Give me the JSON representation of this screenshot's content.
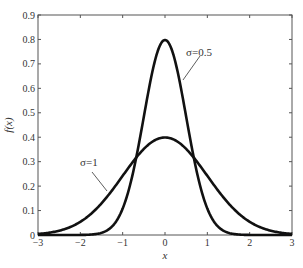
{
  "chart_data": {
    "type": "line",
    "title": "",
    "xlabel": "x",
    "ylabel": "f(x)",
    "xlim": [
      -3,
      3
    ],
    "ylim": [
      0,
      0.9
    ],
    "grid": false,
    "legend": "none (inline annotations)",
    "x_ticks": [
      "−3",
      "−2",
      "−1",
      "0",
      "1",
      "2",
      "3"
    ],
    "y_ticks": [
      "0",
      "0.1",
      "0.2",
      "0.3",
      "0.4",
      "0.5",
      "0.6",
      "0.7",
      "0.8",
      "0.9"
    ],
    "series": [
      {
        "name": "σ=0.5",
        "sigma": 0.5,
        "mu": 0,
        "x": [
          -3,
          -2,
          -1.5,
          -1,
          -0.5,
          0,
          0.5,
          1,
          1.5,
          2,
          3
        ],
        "values": [
          0.0,
          0.0003,
          0.0089,
          0.108,
          0.484,
          0.798,
          0.484,
          0.108,
          0.0089,
          0.0003,
          0.0
        ]
      },
      {
        "name": "σ=1",
        "sigma": 1,
        "mu": 0,
        "x": [
          -3,
          -2,
          -1.5,
          -1,
          -0.5,
          0,
          0.5,
          1,
          1.5,
          2,
          3
        ],
        "values": [
          0.0044,
          0.054,
          0.13,
          0.242,
          0.352,
          0.399,
          0.352,
          0.242,
          0.13,
          0.054,
          0.0044
        ]
      }
    ],
    "annotations": [
      {
        "text": "σ=0.5",
        "points_to_series": "σ=0.5"
      },
      {
        "text": "σ=1",
        "points_to_series": "σ=1"
      }
    ]
  }
}
